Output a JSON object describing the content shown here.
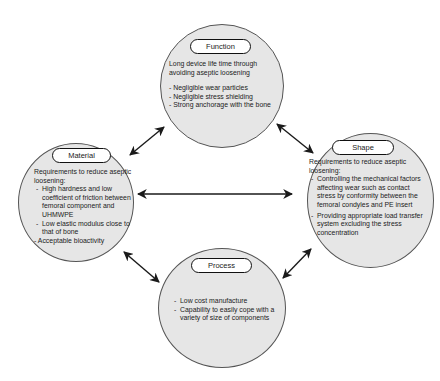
{
  "diagram": {
    "nodes": {
      "function": {
        "title": "Function",
        "intro": "Long device life time through avoiding aseptic loosening",
        "items": [
          "Negligible wear particles",
          "Negligible stress shielding",
          "Strong anchorage with the bone"
        ]
      },
      "material": {
        "title": "Material",
        "intro": "Requirements to reduce aseptic loosening:",
        "items": [
          "High hardness and low coefficient of friction between femoral component and UHMWPE",
          "Low elastic modulus close to that of bone"
        ],
        "extra": "- Acceptable bioactivity"
      },
      "shape": {
        "title": "Shape",
        "intro": "Requirements to reduce aseptic loosening:",
        "items": [
          "Controlling the mechanical factors affecting wear such as contact stress by conformity between the femoral condyles and PE insert",
          "Providing appropriate load transfer system excluding the stress concentration"
        ]
      },
      "process": {
        "title": "Process",
        "items": [
          "Low cost manufacture",
          "Capability to easily cope with a variety of size of components"
        ]
      }
    },
    "edges": [
      {
        "from": "material",
        "to": "function",
        "type": "bidirectional"
      },
      {
        "from": "function",
        "to": "shape",
        "type": "bidirectional"
      },
      {
        "from": "material",
        "to": "shape",
        "type": "bidirectional"
      },
      {
        "from": "material",
        "to": "process",
        "type": "bidirectional"
      },
      {
        "from": "process",
        "to": "shape",
        "type": "bidirectional"
      }
    ],
    "colors": {
      "node_fill": "#e6e6e6",
      "node_border": "#555555",
      "arrow": "#1a1a1a",
      "pill_fill": "#ffffff"
    }
  }
}
